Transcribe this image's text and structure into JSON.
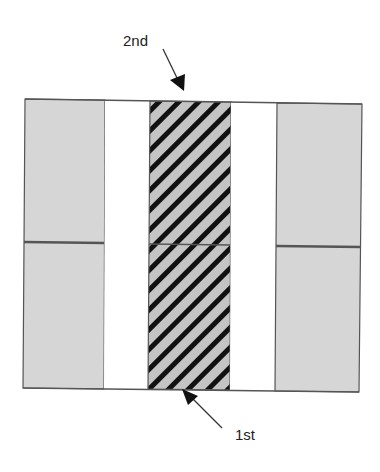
{
  "labels": {
    "second": "2nd",
    "first": "1st"
  },
  "colors": {
    "panel_fill": "#d6d6d6",
    "hatch_fill": "#c4c4c4",
    "hatch_stripe": "#111111",
    "outline": "#555555",
    "gap_fill": "#ffffff",
    "arrow": "#111111"
  },
  "structure": {
    "columns": [
      "grey-panel-left",
      "gap-left",
      "hatched-center",
      "gap-right",
      "grey-panel-right"
    ],
    "rows": 2
  }
}
